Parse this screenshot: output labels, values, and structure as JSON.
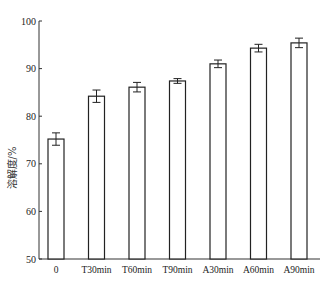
{
  "chart_data": {
    "type": "bar",
    "title": "",
    "xlabel": "",
    "ylabel": "溶解度/%",
    "ylim": [
      50,
      100
    ],
    "yticks": [
      50,
      60,
      70,
      80,
      90,
      100
    ],
    "grid": false,
    "legend": null,
    "categories": [
      "0",
      "T30min",
      "T60min",
      "T90min",
      "A30min",
      "A60min",
      "A90min"
    ],
    "values": [
      75.2,
      84.2,
      86.1,
      87.4,
      91.0,
      94.3,
      95.4
    ],
    "errors": [
      1.3,
      1.3,
      1.0,
      0.5,
      0.8,
      0.8,
      1.0
    ],
    "bar_fill": "#ffffff",
    "bar_stroke": "#222222"
  }
}
